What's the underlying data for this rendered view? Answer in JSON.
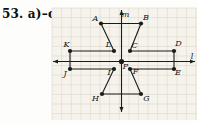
{
  "title": "53. a)–c)",
  "figure": {
    "colors": {
      "ink": "#1a1a1a",
      "label": "#111111",
      "grid_line": "#dcd7c9",
      "grid_bg": "#f5f3ec"
    },
    "grid": {
      "x": 52,
      "y": 8,
      "w": 145,
      "h": 112,
      "cell": 9.6
    },
    "lines": [
      {
        "name": "l",
        "label": "l",
        "x1": 53,
        "y1": 61.5,
        "x2": 195,
        "y2": 61.5,
        "label_x": 192,
        "label_y": 56.5
      },
      {
        "name": "m",
        "label": "m",
        "x1": 121.5,
        "y1": 112,
        "x2": 121.5,
        "y2": 10,
        "label_x": 125.5,
        "label_y": 15
      }
    ],
    "points": [
      {
        "label": "A",
        "x": 101,
        "y": 23.5,
        "lx": 95.5,
        "ly": 18.5,
        "r": 2.1
      },
      {
        "label": "B",
        "x": 141,
        "y": 23.5,
        "lx": 146,
        "ly": 17.5,
        "r": 2.1
      },
      {
        "label": "K",
        "x": 70,
        "y": 51,
        "lx": 66.5,
        "ly": 45,
        "r": 2.1
      },
      {
        "label": "L",
        "x": 114,
        "y": 51,
        "lx": 108.5,
        "ly": 44.5,
        "r": 2.1
      },
      {
        "label": "C",
        "x": 130,
        "y": 51,
        "lx": 134.5,
        "ly": 45.5,
        "r": 2.1
      },
      {
        "label": "D",
        "x": 174,
        "y": 51,
        "lx": 178.5,
        "ly": 43.5,
        "r": 2.1
      },
      {
        "label": "P",
        "x": 121.5,
        "y": 61.5,
        "lx": 125.5,
        "ly": 66.5,
        "r": 2.6
      },
      {
        "label": "J",
        "x": 70,
        "y": 69,
        "lx": 65,
        "ly": 73.5,
        "r": 2.1
      },
      {
        "label": "I",
        "x": 114,
        "y": 69,
        "lx": 109,
        "ly": 73,
        "r": 2.1
      },
      {
        "label": "F",
        "x": 130,
        "y": 69,
        "lx": 135.5,
        "ly": 71.5,
        "r": 2.1
      },
      {
        "label": "E",
        "x": 174,
        "y": 69,
        "lx": 178,
        "ly": 73,
        "r": 2.1
      },
      {
        "label": "H",
        "x": 102,
        "y": 94,
        "lx": 95.5,
        "ly": 98.5,
        "r": 2.1
      },
      {
        "label": "G",
        "x": 141,
        "y": 94,
        "lx": 146.5,
        "ly": 98.5,
        "r": 2.1
      }
    ],
    "segments": [
      [
        "A",
        "B"
      ],
      [
        "A",
        "L"
      ],
      [
        "B",
        "C"
      ],
      [
        "K",
        "L"
      ],
      [
        "C",
        "D"
      ],
      [
        "K",
        "J"
      ],
      [
        "D",
        "E"
      ],
      [
        "J",
        "I"
      ],
      [
        "F",
        "E"
      ],
      [
        "I",
        "H"
      ],
      [
        "F",
        "G"
      ],
      [
        "H",
        "G"
      ]
    ]
  }
}
